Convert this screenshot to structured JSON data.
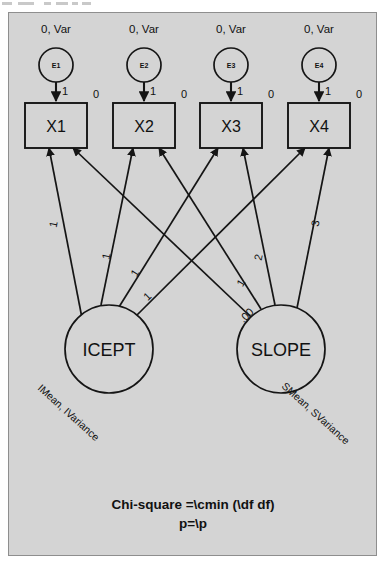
{
  "diagram": {
    "type": "latent-growth-curve-model",
    "errors": [
      {
        "id": "E1",
        "name": "E1",
        "moment_label": "0, Var",
        "loading": "1",
        "x": 47,
        "cy": 52
      },
      {
        "id": "E2",
        "name": "E2",
        "moment_label": "0, Var",
        "loading": "1",
        "x": 135,
        "cy": 52
      },
      {
        "id": "E3",
        "name": "E3",
        "moment_label": "0, Var",
        "loading": "1",
        "x": 222,
        "cy": 52
      },
      {
        "id": "E4",
        "name": "E4",
        "moment_label": "0, Var",
        "loading": "1",
        "x": 310,
        "cy": 52
      }
    ],
    "indicators": [
      {
        "id": "X1",
        "label": "X1",
        "intercept": "0",
        "x": 16,
        "y": 90
      },
      {
        "id": "X2",
        "label": "X2",
        "intercept": "0",
        "x": 104,
        "y": 90
      },
      {
        "id": "X3",
        "label": "X3",
        "intercept": "0",
        "x": 191,
        "y": 90
      },
      {
        "id": "X4",
        "label": "X4",
        "intercept": "0",
        "x": 279,
        "y": 90
      }
    ],
    "factors": [
      {
        "id": "ICEPT",
        "label": "ICEPT",
        "moment_label": "IMean, IVariance",
        "cx": 100,
        "cy": 336,
        "r": 44
      },
      {
        "id": "SLOPE",
        "label": "SLOPE",
        "moment_label": "SMean, SVariance",
        "cx": 272,
        "cy": 336,
        "r": 44
      }
    ],
    "loadings": [
      {
        "from": "ICEPT",
        "to": "X1",
        "value": "1"
      },
      {
        "from": "ICEPT",
        "to": "X2",
        "value": "1"
      },
      {
        "from": "ICEPT",
        "to": "X3",
        "value": "1"
      },
      {
        "from": "ICEPT",
        "to": "X4",
        "value": "1"
      },
      {
        "from": "SLOPE",
        "to": "X1",
        "value": ".00"
      },
      {
        "from": "SLOPE",
        "to": "X2",
        "value": "1"
      },
      {
        "from": "SLOPE",
        "to": "X3",
        "value": "2"
      },
      {
        "from": "SLOPE",
        "to": "X4",
        "value": "3"
      }
    ],
    "caption": {
      "line1": "Chi-square =\\cmin (\\df df)",
      "line2": "p=\\p"
    }
  }
}
